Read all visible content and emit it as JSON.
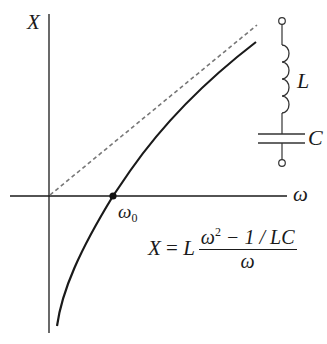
{
  "diagram": {
    "axes": {
      "y_label": "X",
      "x_label": "ω"
    },
    "resonance_point": {
      "label_base": "ω",
      "label_sub": "0"
    },
    "circuit": {
      "inductor_label": "L",
      "capacitor_label": "C"
    },
    "formula": {
      "lhs": "X",
      "equals": " = ",
      "coef": "L",
      "num_base": "ω",
      "num_sup": "2",
      "num_rest": " − 1 / LC",
      "den": "ω"
    },
    "colors": {
      "ink": "#1a1a1a",
      "dashed": "#777777",
      "background": "#ffffff"
    }
  }
}
